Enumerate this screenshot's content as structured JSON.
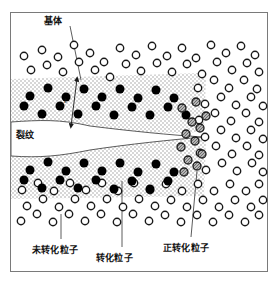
{
  "diagram": {
    "title_visible": false,
    "frame": {
      "x": 10,
      "y": 12,
      "w": 258,
      "h": 260,
      "border_color": "#7a7a7a"
    },
    "colors": {
      "matrix_particle_fill": "#ffffff",
      "matrix_particle_stroke": "#1a1a1a",
      "transformed_particle_fill": "#000000",
      "transforming_particle_fill": "#9a9a9a",
      "transforming_particle_stroke": "#1a1a1a",
      "zone_stipple": "#9b9b9b",
      "crack_stroke": "#4a4a4a",
      "leader_stroke": "#4a4a4a",
      "text": "#111111"
    },
    "labels": [
      {
        "id": "matrix",
        "text": "基体",
        "x": 44,
        "y": 14,
        "leader": {
          "x1": 70,
          "y1": 26,
          "x2": 81,
          "y2": 80
        }
      },
      {
        "id": "crack",
        "text": "裂纹",
        "x": 16,
        "y": 128,
        "leader": null
      },
      {
        "id": "untransformed-particle",
        "text": "未转化粒子",
        "x": 37,
        "y": 244,
        "leader": {
          "x1": 61,
          "y1": 241,
          "x2": 61,
          "y2": 216
        }
      },
      {
        "id": "transformed-particle",
        "text": "转化粒子",
        "x": 98,
        "y": 252,
        "leader": {
          "x1": 122,
          "y1": 249,
          "x2": 122,
          "y2": 182
        }
      },
      {
        "id": "transforming-particle",
        "text": "正转化粒子",
        "x": 167,
        "y": 242,
        "leader": {
          "x1": 191,
          "y1": 239,
          "x2": 197,
          "y2": 172
        }
      }
    ],
    "zone_dimension": {
      "symbol": "t",
      "x": 66,
      "y": 100,
      "arrow": {
        "x1": 77,
        "y1": 80,
        "x2": 71,
        "y2": 125
      }
    },
    "crack_outline": "wedge opening left, apex at right",
    "zones": [
      {
        "id": "upper-transformation-zone",
        "description": "stippled band above crack"
      },
      {
        "id": "lower-transformation-zone",
        "description": "stippled band below crack"
      }
    ],
    "legend_items": [
      {
        "key": "open-circle",
        "meaning": "未转化粒子"
      },
      {
        "key": "filled-black-circle",
        "meaning": "转化粒子"
      },
      {
        "key": "gray-hatched-circle",
        "meaning": "正转化粒子"
      }
    ]
  },
  "particles": {
    "open": [
      [
        24,
        56
      ],
      [
        42,
        50
      ],
      [
        58,
        57
      ],
      [
        74,
        45
      ],
      [
        90,
        53
      ],
      [
        104,
        62
      ],
      [
        120,
        48
      ],
      [
        136,
        55
      ],
      [
        152,
        46
      ],
      [
        167,
        56
      ],
      [
        182,
        48
      ],
      [
        196,
        58
      ],
      [
        211,
        45
      ],
      [
        226,
        53
      ],
      [
        241,
        46
      ],
      [
        255,
        55
      ],
      [
        31,
        70
      ],
      [
        47,
        65
      ],
      [
        63,
        72
      ],
      [
        79,
        62
      ],
      [
        95,
        70
      ],
      [
        110,
        77
      ],
      [
        126,
        64
      ],
      [
        141,
        71
      ],
      [
        157,
        63
      ],
      [
        172,
        72
      ],
      [
        187,
        64
      ],
      [
        202,
        74
      ],
      [
        217,
        62
      ],
      [
        232,
        70
      ],
      [
        247,
        63
      ],
      [
        259,
        72
      ],
      [
        198,
        88
      ],
      [
        214,
        80
      ],
      [
        229,
        88
      ],
      [
        244,
        80
      ],
      [
        257,
        89
      ],
      [
        205,
        104
      ],
      [
        221,
        97
      ],
      [
        236,
        105
      ],
      [
        251,
        97
      ],
      [
        263,
        106
      ],
      [
        199,
        120
      ],
      [
        215,
        113
      ],
      [
        231,
        121
      ],
      [
        246,
        113
      ],
      [
        259,
        122
      ],
      [
        205,
        137
      ],
      [
        221,
        130
      ],
      [
        236,
        138
      ],
      [
        251,
        130
      ],
      [
        263,
        139
      ],
      [
        200,
        153
      ],
      [
        216,
        146
      ],
      [
        232,
        154
      ],
      [
        247,
        146
      ],
      [
        259,
        155
      ],
      [
        206,
        170
      ],
      [
        222,
        163
      ],
      [
        237,
        171
      ],
      [
        252,
        163
      ],
      [
        263,
        172
      ],
      [
        22,
        190
      ],
      [
        38,
        183
      ],
      [
        54,
        191
      ],
      [
        70,
        183
      ],
      [
        86,
        190
      ],
      [
        102,
        183
      ],
      [
        118,
        191
      ],
      [
        134,
        183
      ],
      [
        150,
        190
      ],
      [
        166,
        184
      ],
      [
        182,
        191
      ],
      [
        198,
        184
      ],
      [
        214,
        191
      ],
      [
        230,
        184
      ],
      [
        246,
        191
      ],
      [
        259,
        184
      ],
      [
        27,
        206
      ],
      [
        43,
        199
      ],
      [
        59,
        207
      ],
      [
        75,
        199
      ],
      [
        91,
        206
      ],
      [
        107,
        199
      ],
      [
        123,
        207
      ],
      [
        139,
        199
      ],
      [
        155,
        206
      ],
      [
        171,
        200
      ],
      [
        187,
        207
      ],
      [
        203,
        200
      ],
      [
        219,
        207
      ],
      [
        235,
        200
      ],
      [
        251,
        207
      ],
      [
        263,
        200
      ],
      [
        21,
        221
      ],
      [
        37,
        214
      ],
      [
        53,
        222
      ],
      [
        69,
        214
      ],
      [
        85,
        221
      ],
      [
        101,
        214
      ],
      [
        117,
        222
      ],
      [
        133,
        214
      ],
      [
        149,
        221
      ],
      [
        165,
        215
      ],
      [
        181,
        222
      ],
      [
        197,
        215
      ],
      [
        213,
        222
      ],
      [
        229,
        215
      ],
      [
        245,
        222
      ],
      [
        259,
        215
      ]
    ],
    "transformed": [
      [
        30,
        96
      ],
      [
        48,
        88
      ],
      [
        66,
        97
      ],
      [
        84,
        89
      ],
      [
        102,
        97
      ],
      [
        120,
        89
      ],
      [
        138,
        98
      ],
      [
        156,
        90
      ],
      [
        174,
        98
      ],
      [
        24,
        106
      ],
      [
        42,
        114
      ],
      [
        60,
        106
      ],
      [
        78,
        114
      ],
      [
        96,
        106
      ],
      [
        114,
        115
      ],
      [
        132,
        107
      ],
      [
        150,
        115
      ],
      [
        168,
        107
      ],
      [
        186,
        115
      ],
      [
        30,
        170
      ],
      [
        48,
        162
      ],
      [
        66,
        171
      ],
      [
        84,
        163
      ],
      [
        102,
        171
      ],
      [
        120,
        163
      ],
      [
        138,
        172
      ],
      [
        156,
        164
      ],
      [
        174,
        172
      ],
      [
        24,
        180
      ],
      [
        42,
        188
      ],
      [
        60,
        180
      ],
      [
        78,
        188
      ],
      [
        96,
        180
      ],
      [
        114,
        189
      ],
      [
        132,
        181
      ],
      [
        150,
        189
      ],
      [
        168,
        181
      ]
    ],
    "transforming": [
      [
        182,
        108
      ],
      [
        196,
        102
      ],
      [
        192,
        122
      ],
      [
        206,
        116
      ],
      [
        186,
        134
      ],
      [
        200,
        128
      ],
      [
        181,
        147
      ],
      [
        195,
        141
      ],
      [
        188,
        160
      ],
      [
        202,
        154
      ],
      [
        184,
        172
      ],
      [
        197,
        166
      ]
    ]
  }
}
